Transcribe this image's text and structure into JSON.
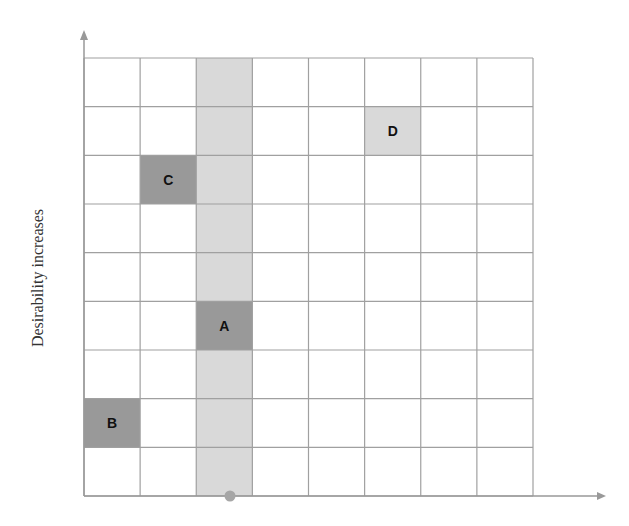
{
  "diagram": {
    "type": "grid-matrix",
    "y_axis_label": "Desirability increases",
    "x_axis_label": "",
    "grid": {
      "columns": 8,
      "rows": 9,
      "left": 84,
      "right": 533,
      "top": 58,
      "bottom": 496,
      "line_color": "#a0a0a0"
    },
    "highlight_column": {
      "index": 2,
      "color": "#d9d9d9"
    },
    "items": [
      {
        "label": "A",
        "col": 2,
        "row": 5,
        "color": "#999999"
      },
      {
        "label": "B",
        "col": 0,
        "row": 7,
        "color": "#999999"
      },
      {
        "label": "C",
        "col": 1,
        "row": 2,
        "color": "#999999"
      },
      {
        "label": "D",
        "col": 5,
        "row": 1,
        "color": "#d9d9d9"
      }
    ],
    "marker": {
      "x": 230,
      "y": 496,
      "color": "#a6a6a6",
      "description": "dot on x-axis below highlighted column"
    },
    "axis_color": "#999999"
  }
}
